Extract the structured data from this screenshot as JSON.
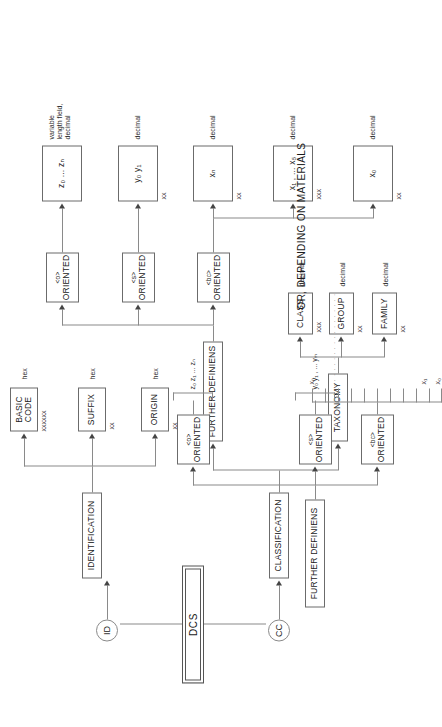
{
  "diagram": {
    "title": "DCS",
    "note": "OR, DEPENDING ON MATERIALS",
    "root": {
      "label": "DCS"
    },
    "entry_points": [
      {
        "id": "id",
        "label": "ID"
      },
      {
        "id": "cc",
        "label": "CC"
      }
    ],
    "identification": {
      "label": "IDENTIFICATION",
      "children": [
        {
          "label": "BASIC\nCODE",
          "format": "xxxxxx",
          "type": "hex"
        },
        {
          "label": "SUFFIX",
          "format": "xx",
          "type": "hex"
        },
        {
          "label": "ORIGIN",
          "format": "xx",
          "type": "hex"
        }
      ]
    },
    "classification": {
      "label": "CLASSIFICATION",
      "taxonomy": {
        "label": "TAXONOMY",
        "children": [
          {
            "label": "FAMILY",
            "format": "xx",
            "type": "decimal"
          },
          {
            "label": "GROUP",
            "format": "xx",
            "type": "decimal"
          },
          {
            "label": "CLASS",
            "format": "xxx",
            "type": "decimal"
          }
        ]
      },
      "further_definiens": {
        "label": "FURTHER DEFINIENS",
        "children": [
          {
            "tag": "<bc>",
            "label": "ORIENTED"
          },
          {
            "tag": "<s>",
            "label": "ORIENTED"
          },
          {
            "tag": "<o>",
            "label": "ORIENTED"
          }
        ]
      }
    },
    "value_fields": [
      {
        "value": "x₀",
        "format": "xx",
        "type": "decimal"
      },
      {
        "value": "x₁ , ... x₅",
        "format": "xxx",
        "type": "decimal"
      },
      {
        "value": "xₙ",
        "format": "xx",
        "type": "decimal"
      },
      {
        "value": "y₀ y₁",
        "format": "xx",
        "type": "decimal"
      },
      {
        "value": "z₀ ... zₙ",
        "format": "",
        "type": "variable\nlength field,\ndecimal"
      }
    ],
    "materials_alt": {
      "label": "FURTHER DEFINIENS",
      "branches": [
        {
          "tag": "<bc>",
          "label": "ORIENTED",
          "range_start": "x₀",
          "range_mid": "x₁",
          "range_end": "xₙ",
          "style": "comb"
        },
        {
          "tag": "<s>",
          "label": "ORIENTED",
          "range": "y₀ y₁ , ... yₘ",
          "style": "bracket"
        },
        {
          "tag": "<o>",
          "label": "ORIENTED",
          "range": "z₀ z₁ ... zₙ",
          "style": "bracket"
        }
      ]
    }
  }
}
